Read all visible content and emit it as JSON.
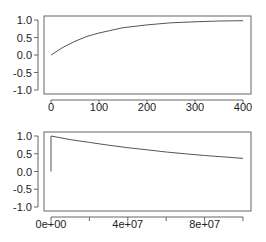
{
  "chart_data": [
    {
      "type": "line",
      "title": "",
      "xlabel": "",
      "ylabel": "",
      "xlim": [
        0,
        400
      ],
      "ylim": [
        -1.0,
        1.0
      ],
      "grid": false,
      "legend": null,
      "x_ticks": [
        "0",
        "100",
        "200",
        "300",
        "400"
      ],
      "y_ticks": [
        "1.0",
        "0.5",
        "0.0",
        "-0.5",
        "-1.0"
      ],
      "series": [
        {
          "name": "curve",
          "color": "#555555",
          "x": [
            0,
            25,
            50,
            75,
            100,
            150,
            200,
            250,
            300,
            350,
            400
          ],
          "values": [
            0.0,
            0.22,
            0.39,
            0.53,
            0.63,
            0.78,
            0.86,
            0.92,
            0.95,
            0.97,
            0.98
          ]
        }
      ]
    },
    {
      "type": "line",
      "title": "",
      "xlabel": "",
      "ylabel": "",
      "xlim": [
        0,
        100000000
      ],
      "ylim": [
        -1.0,
        1.0
      ],
      "grid": false,
      "legend": null,
      "x_ticks": [
        "0e+00",
        "",
        "4e+07",
        "",
        "8e+07",
        ""
      ],
      "x_tick_values": [
        0,
        20000000,
        40000000,
        60000000,
        80000000,
        100000000
      ],
      "y_ticks": [
        "1.0",
        "0.5",
        "0.0",
        "-0.5",
        "-1.0"
      ],
      "series": [
        {
          "name": "curve",
          "color": "#555555",
          "x": [
            0,
            0,
            10000000,
            20000000,
            30000000,
            40000000,
            50000000,
            60000000,
            70000000,
            80000000,
            90000000,
            100000000
          ],
          "values": [
            0.0,
            1.0,
            0.9,
            0.82,
            0.74,
            0.67,
            0.61,
            0.55,
            0.5,
            0.45,
            0.41,
            0.37
          ]
        }
      ]
    }
  ]
}
